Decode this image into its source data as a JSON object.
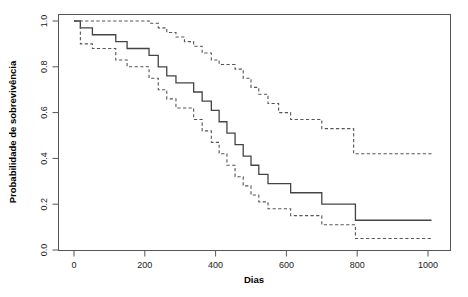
{
  "chart_data": {
    "type": "line",
    "title": "",
    "subtitle": "",
    "xlabel": "Dias",
    "ylabel": "Probabilidade de sobrevivência",
    "xlim": [
      -40,
      1050
    ],
    "ylim": [
      0.0,
      1.0
    ],
    "grid": false,
    "legend": null,
    "xticks": [
      0,
      200,
      400,
      600,
      800,
      1000
    ],
    "xtick_labels": [
      "0",
      "200",
      "400",
      "600",
      "800",
      "1000"
    ],
    "yticks": [
      0.0,
      0.2,
      0.4,
      0.6,
      0.8,
      1.0
    ],
    "ytick_labels": [
      "0.0",
      "0.2",
      "0.4",
      "0.6",
      "0.8",
      "1.0"
    ],
    "series": [
      {
        "name": "Estimativa de Kaplan-Meier",
        "style": "solid",
        "color": "#444444",
        "step": "post",
        "x": [
          0,
          18,
          52,
          85,
          118,
          150,
          185,
          212,
          238,
          262,
          288,
          312,
          338,
          362,
          388,
          410,
          432,
          455,
          478,
          500,
          522,
          548,
          578,
          612,
          648,
          700,
          795,
          1010
        ],
        "y": [
          1.0,
          0.97,
          0.94,
          0.94,
          0.91,
          0.88,
          0.88,
          0.85,
          0.8,
          0.76,
          0.73,
          0.73,
          0.69,
          0.65,
          0.61,
          0.56,
          0.51,
          0.46,
          0.41,
          0.37,
          0.33,
          0.29,
          0.29,
          0.25,
          0.25,
          0.2,
          0.13,
          0.13
        ]
      },
      {
        "name": "Limite superior do IC 95%",
        "style": "dashed",
        "color": "#555555",
        "step": "post",
        "x": [
          0,
          185,
          212,
          238,
          262,
          288,
          312,
          338,
          362,
          388,
          410,
          432,
          455,
          478,
          500,
          522,
          548,
          578,
          612,
          648,
          700,
          790,
          1010
        ],
        "y": [
          1.0,
          1.0,
          0.99,
          0.97,
          0.95,
          0.93,
          0.91,
          0.89,
          0.86,
          0.83,
          0.81,
          0.81,
          0.79,
          0.75,
          0.71,
          0.68,
          0.64,
          0.6,
          0.57,
          0.57,
          0.53,
          0.42,
          0.42
        ]
      },
      {
        "name": "Limite inferior do IC 95%",
        "style": "dashed",
        "color": "#555555",
        "step": "post",
        "x": [
          0,
          18,
          52,
          85,
          118,
          150,
          185,
          212,
          238,
          262,
          288,
          312,
          338,
          362,
          388,
          410,
          432,
          455,
          478,
          500,
          522,
          548,
          578,
          612,
          648,
          700,
          795,
          1010
        ],
        "y": [
          1.0,
          0.9,
          0.88,
          0.88,
          0.83,
          0.8,
          0.8,
          0.75,
          0.7,
          0.66,
          0.62,
          0.62,
          0.57,
          0.52,
          0.47,
          0.42,
          0.37,
          0.32,
          0.28,
          0.24,
          0.21,
          0.18,
          0.18,
          0.15,
          0.15,
          0.11,
          0.05,
          0.05
        ]
      }
    ]
  },
  "plot": {
    "box_color": "#555555",
    "background": "#ffffff"
  }
}
